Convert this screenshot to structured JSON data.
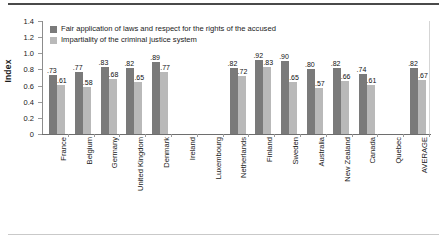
{
  "chart_data": {
    "type": "bar",
    "title": "",
    "subtitle": "",
    "xlabel": "",
    "ylabel": "Index",
    "ylim": [
      0,
      1.4
    ],
    "grid": false,
    "legend_position": "top-left",
    "ytick_labels": [
      "1.4",
      "1.2",
      "1.0",
      "0.8",
      "0.6",
      "0.4",
      "0.2",
      "0"
    ],
    "ytick_values": [
      1.4,
      1.2,
      1.0,
      0.8,
      0.6,
      0.4,
      0.2,
      0
    ],
    "categories": [
      "France",
      "Belgium",
      "Germany",
      "United Kingdom",
      "Denmark",
      "Ireland",
      "Luxembourg",
      "Netherlands",
      "Finland",
      "Sweden",
      "Australia",
      "New Zealand",
      "Canada",
      "Quebec",
      "AVERAGE"
    ],
    "series": [
      {
        "name": "Fair application of laws and respect for the rights of the accused",
        "color": "#7a7a7a",
        "values": [
          0.73,
          0.77,
          0.83,
          0.82,
          0.89,
          null,
          null,
          0.82,
          0.92,
          0.9,
          0.8,
          0.82,
          0.74,
          null,
          0.82
        ],
        "labels": [
          ".73",
          ".77",
          ".83",
          ".82",
          ".89",
          "",
          "",
          ".82",
          ".92",
          ".90",
          ".80",
          ".82",
          ".74",
          "",
          ".82"
        ]
      },
      {
        "name": "Impartiality of the criminal justice system",
        "color": "#b9b9b9",
        "values": [
          0.61,
          0.58,
          0.68,
          0.65,
          0.77,
          null,
          null,
          0.72,
          0.83,
          0.65,
          0.57,
          0.66,
          0.61,
          null,
          0.67
        ],
        "labels": [
          ".61",
          ".58",
          ".68",
          ".65",
          ".77",
          "",
          "",
          ".72",
          ".83",
          ".65",
          ".57",
          ".66",
          ".61",
          "",
          ".67"
        ]
      }
    ]
  },
  "style": {
    "series1_color": "#7a7a7a",
    "series2_color": "#b9b9b9",
    "axis_color": "#6e6e6e",
    "rule_top_color": "#4a4a4a",
    "rule_bottom_color": "#c9c9c9",
    "background": "#ffffff"
  }
}
